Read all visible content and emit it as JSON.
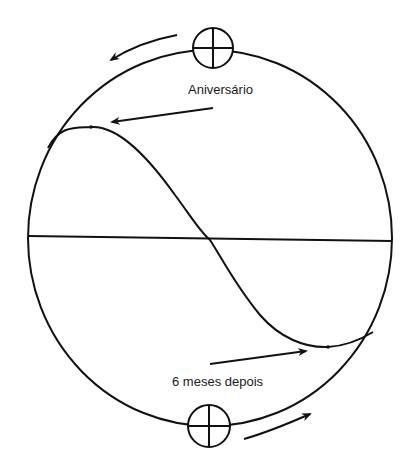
{
  "diagram": {
    "type": "orbital-sine-diagram",
    "labels": {
      "top": "Aniversário",
      "bottom": "6 meses depois"
    },
    "colors": {
      "stroke": "#111111",
      "background": "#ffffff"
    },
    "elements": [
      "outer-circle",
      "horizontal-equator-line",
      "sine-curve",
      "top-sun-symbol",
      "bottom-sun-symbol",
      "top-direction-arrow",
      "bottom-direction-arrow",
      "aniversario-pointer-arrow",
      "six-months-pointer-arrow"
    ]
  }
}
